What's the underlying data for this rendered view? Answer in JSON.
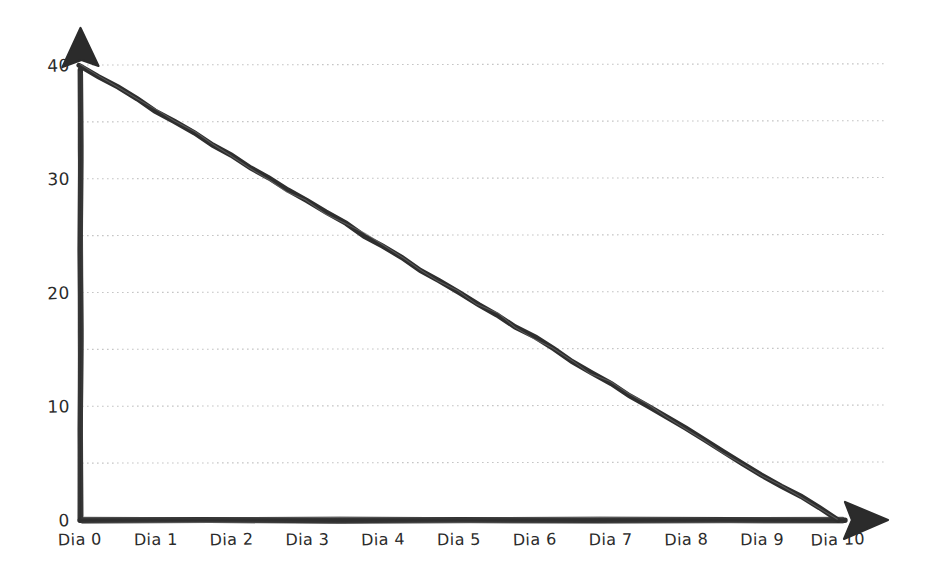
{
  "chart_data": {
    "type": "line",
    "title": "",
    "subtitle": "",
    "xlabel": "",
    "ylabel": "",
    "style": "hand-drawn",
    "categories": [
      "Dia 0",
      "Dia 1",
      "Dia 2",
      "Dia 3",
      "Dia 4",
      "Dia 5",
      "Dia 6",
      "Dia 7",
      "Dia 8",
      "Dia 9",
      "Dia 10"
    ],
    "x": [
      0,
      1,
      2,
      3,
      4,
      5,
      6,
      7,
      8,
      9,
      10
    ],
    "values": [
      40,
      36,
      32,
      28,
      24,
      20,
      16,
      12,
      8,
      4,
      0
    ],
    "series": [
      {
        "name": "",
        "values": [
          40,
          36,
          32,
          28,
          24,
          20,
          16,
          12,
          8,
          4,
          0
        ],
        "color": "#2e2e2e"
      }
    ],
    "ylim": [
      0,
      40
    ],
    "xlim": [
      0,
      10
    ],
    "ytick_labels": [
      "0",
      "10",
      "20",
      "30",
      "40"
    ],
    "ytick_values": [
      0,
      10,
      20,
      30,
      40
    ],
    "gridline_values": [
      5,
      10,
      15,
      20,
      25,
      30,
      35,
      40
    ],
    "grid": true,
    "grid_axis": "y",
    "legend": false,
    "legend_position": "none",
    "annotations": [],
    "axis_arrows": {
      "x_axis_arrow": "right-arrowhead",
      "y_axis_arrow": "up-arrowhead"
    }
  },
  "colors": {
    "background": "#ffffff",
    "axis": "#2f2f2f",
    "line": "#2e2e2e",
    "grid": "#bfbfbf",
    "text": "#2b2b2b"
  }
}
